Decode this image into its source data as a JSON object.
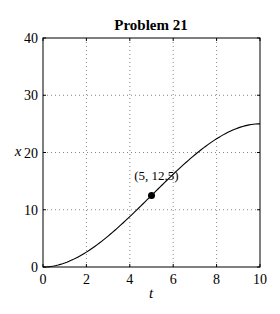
{
  "chart_data": {
    "type": "line",
    "title": "Problem 21",
    "xlabel": "t",
    "ylabel": "x",
    "xlim": [
      0,
      10
    ],
    "ylim": [
      0,
      40
    ],
    "xticks": [
      "0",
      "2",
      "4",
      "6",
      "8",
      "10"
    ],
    "yticks": [
      "0",
      "10",
      "20",
      "30",
      "40"
    ],
    "grid": true,
    "legend": null,
    "series": [
      {
        "name": "x(t)",
        "x": [
          0,
          1,
          2,
          3,
          4,
          5,
          6,
          7,
          8,
          9,
          10
        ],
        "y": [
          0,
          0.7,
          2.6,
          5.4,
          8.8,
          12.5,
          16.2,
          19.6,
          22.4,
          24.3,
          25
        ]
      }
    ],
    "markers": [
      {
        "x": 5,
        "y": 12.5,
        "label": "(5, 12.5)"
      }
    ]
  }
}
